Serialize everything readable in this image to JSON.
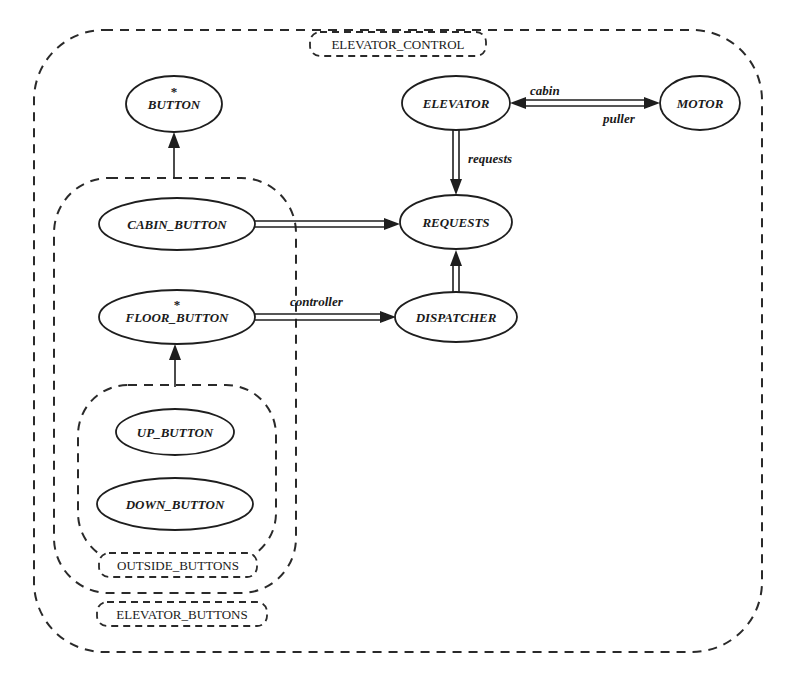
{
  "diagram": {
    "title": "ELEVATOR_CONTROL",
    "clusters": [
      {
        "id": "elevator_control",
        "label": "ELEVATOR_CONTROL",
        "x": 34,
        "y": 30,
        "w": 728,
        "h": 622,
        "r": 70
      },
      {
        "id": "elevator_buttons",
        "label": "ELEVATOR_BUTTONS",
        "x": 54,
        "y": 178,
        "w": 242,
        "h": 415,
        "r": 55
      },
      {
        "id": "outside_buttons",
        "label": "OUTSIDE_BUTTONS",
        "x": 78,
        "y": 385,
        "w": 198,
        "h": 178,
        "r": 50
      }
    ],
    "cluster_tags": [
      {
        "label": "ELEVATOR_CONTROL",
        "x": 310,
        "y": 32,
        "w": 176,
        "h": 24
      },
      {
        "label": "ELEVATOR_BUTTONS",
        "x": 97,
        "y": 602,
        "w": 170,
        "h": 24
      },
      {
        "label": "OUTSIDE_BUTTONS",
        "x": 99,
        "y": 553,
        "w": 158,
        "h": 24
      }
    ],
    "nodes": [
      {
        "id": "button",
        "label": "BUTTON",
        "cx": 174,
        "cy": 104,
        "rx": 48,
        "ry": 28,
        "deferred": true
      },
      {
        "id": "cabin_button",
        "label": "CABIN_BUTTON",
        "cx": 177,
        "cy": 224,
        "rx": 78,
        "ry": 26,
        "deferred": false
      },
      {
        "id": "floor_button",
        "label": "FLOOR_BUTTON",
        "cx": 177,
        "cy": 317,
        "rx": 78,
        "ry": 27,
        "deferred": true
      },
      {
        "id": "up_button",
        "label": "UP_BUTTON",
        "cx": 175,
        "cy": 432,
        "rx": 59,
        "ry": 23,
        "deferred": false
      },
      {
        "id": "down_button",
        "label": "DOWN_BUTTON",
        "cx": 175,
        "cy": 504,
        "rx": 78,
        "ry": 26,
        "deferred": false
      },
      {
        "id": "elevator",
        "label": "ELEVATOR",
        "cx": 456,
        "cy": 103,
        "rx": 54,
        "ry": 27,
        "deferred": false
      },
      {
        "id": "motor",
        "label": "MOTOR",
        "cx": 700,
        "cy": 103,
        "rx": 40,
        "ry": 27,
        "deferred": false
      },
      {
        "id": "requests",
        "label": "REQUESTS",
        "cx": 456,
        "cy": 222,
        "rx": 56,
        "ry": 27,
        "deferred": false
      },
      {
        "id": "dispatcher",
        "label": "DISPATCHER",
        "cx": 456,
        "cy": 317,
        "rx": 61,
        "ry": 25,
        "deferred": false
      }
    ],
    "edges": [
      {
        "from": "button_button",
        "kind": "inheritance",
        "label": ""
      },
      {
        "from": "floor_button",
        "to": "outside_buttons",
        "kind": "inheritance",
        "label": ""
      },
      {
        "from": "cabin_button",
        "to": "requests",
        "kind": "client",
        "label": ""
      },
      {
        "from": "floor_button",
        "to": "dispatcher",
        "kind": "client",
        "label": "controller"
      },
      {
        "from": "dispatcher",
        "to": "requests",
        "kind": "client",
        "label": ""
      },
      {
        "from": "elevator",
        "to": "requests",
        "kind": "client",
        "label": "requests"
      },
      {
        "from": "elevator",
        "to": "motor",
        "kind": "client",
        "label": "puller"
      },
      {
        "from": "motor",
        "to": "elevator",
        "kind": "client",
        "label": "cabin"
      }
    ],
    "edge_labels": {
      "cabin": "cabin",
      "puller": "puller",
      "requests": "requests",
      "controller": "controller"
    },
    "deferred_marker": "*",
    "colors": {
      "ink": "#1e1e1e",
      "background": "#ffffff"
    }
  }
}
